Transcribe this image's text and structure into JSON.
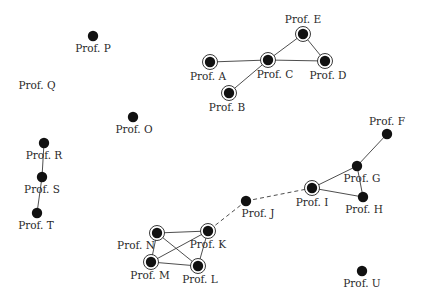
{
  "diagram": {
    "type": "network-graph",
    "nodes": [
      {
        "id": "A",
        "label": "Prof. A",
        "x": 210,
        "y": 62,
        "ringed": true,
        "lx": 208,
        "ly": 80
      },
      {
        "id": "B",
        "label": "Prof. B",
        "x": 229,
        "y": 93,
        "ringed": true,
        "lx": 227,
        "ly": 111
      },
      {
        "id": "C",
        "label": "Prof. C",
        "x": 268,
        "y": 60,
        "ringed": true,
        "lx": 275,
        "ly": 78
      },
      {
        "id": "D",
        "label": "Prof. D",
        "x": 325,
        "y": 61,
        "ringed": true,
        "lx": 328,
        "ly": 79
      },
      {
        "id": "E",
        "label": "Prof. E",
        "x": 303,
        "y": 34,
        "ringed": true,
        "lx": 303,
        "ly": 23
      },
      {
        "id": "F",
        "label": "Prof. F",
        "x": 387,
        "y": 134,
        "ringed": false,
        "lx": 387,
        "ly": 125
      },
      {
        "id": "G",
        "label": "Prof. G",
        "x": 357,
        "y": 166,
        "ringed": false,
        "lx": 362,
        "ly": 182
      },
      {
        "id": "H",
        "label": "Prof. H",
        "x": 363,
        "y": 197,
        "ringed": false,
        "lx": 364,
        "ly": 213
      },
      {
        "id": "I",
        "label": "Prof. I",
        "x": 312,
        "y": 188,
        "ringed": true,
        "lx": 312,
        "ly": 206
      },
      {
        "id": "J",
        "label": "Prof. J",
        "x": 246,
        "y": 201,
        "ringed": false,
        "lx": 258,
        "ly": 217
      },
      {
        "id": "K",
        "label": "Prof. K",
        "x": 208,
        "y": 231,
        "ringed": true,
        "lx": 208,
        "ly": 248
      },
      {
        "id": "L",
        "label": "Prof. L",
        "x": 198,
        "y": 266,
        "ringed": true,
        "lx": 200,
        "ly": 283
      },
      {
        "id": "M",
        "label": "Prof. M",
        "x": 151,
        "y": 262,
        "ringed": true,
        "lx": 150,
        "ly": 279
      },
      {
        "id": "N",
        "label": "Prof. N",
        "x": 157,
        "y": 233,
        "ringed": true,
        "lx": 136,
        "ly": 249
      },
      {
        "id": "O",
        "label": "Prof. O",
        "x": 133,
        "y": 117,
        "ringed": false,
        "lx": 134,
        "ly": 133
      },
      {
        "id": "P",
        "label": "Prof. P",
        "x": 93,
        "y": 36,
        "ringed": false,
        "lx": 93,
        "ly": 52
      },
      {
        "id": "Q",
        "label": "Prof. Q",
        "x": 38,
        "y": 85,
        "ringed": false,
        "hidden_dot": true,
        "lx": 37,
        "ly": 89
      },
      {
        "id": "R",
        "label": "Prof. R",
        "x": 44,
        "y": 143,
        "ringed": false,
        "lx": 44,
        "ly": 159
      },
      {
        "id": "S",
        "label": "Prof. S",
        "x": 42,
        "y": 177,
        "ringed": false,
        "lx": 42,
        "ly": 193
      },
      {
        "id": "T",
        "label": "Prof. T",
        "x": 37,
        "y": 213,
        "ringed": false,
        "lx": 36,
        "ly": 229
      },
      {
        "id": "U",
        "label": "Prof. U",
        "x": 362,
        "y": 271,
        "ringed": false,
        "lx": 362,
        "ly": 287
      }
    ],
    "edges": [
      {
        "from": "A",
        "to": "C",
        "style": "solid"
      },
      {
        "from": "B",
        "to": "C",
        "style": "solid"
      },
      {
        "from": "C",
        "to": "D",
        "style": "solid"
      },
      {
        "from": "C",
        "to": "E",
        "style": "solid"
      },
      {
        "from": "E",
        "to": "D",
        "style": "solid"
      },
      {
        "from": "F",
        "to": "G",
        "style": "solid"
      },
      {
        "from": "G",
        "to": "I",
        "style": "solid"
      },
      {
        "from": "G",
        "to": "H",
        "style": "solid"
      },
      {
        "from": "I",
        "to": "H",
        "style": "solid"
      },
      {
        "from": "I",
        "to": "J",
        "style": "dashed"
      },
      {
        "from": "J",
        "to": "K",
        "style": "dashed"
      },
      {
        "from": "N",
        "to": "K",
        "style": "solid"
      },
      {
        "from": "N",
        "to": "M",
        "style": "solid"
      },
      {
        "from": "N",
        "to": "L",
        "style": "solid"
      },
      {
        "from": "M",
        "to": "K",
        "style": "solid"
      },
      {
        "from": "M",
        "to": "L",
        "style": "solid"
      },
      {
        "from": "K",
        "to": "L",
        "style": "solid"
      },
      {
        "from": "R",
        "to": "S",
        "style": "solid"
      },
      {
        "from": "S",
        "to": "T",
        "style": "solid"
      }
    ]
  }
}
